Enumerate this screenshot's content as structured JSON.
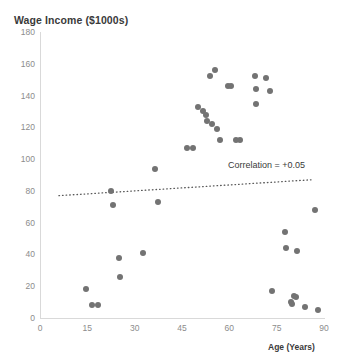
{
  "chart_data": {
    "type": "scatter",
    "title": "Wage Income ($1000s)",
    "xlabel": "Age (Years)",
    "ylabel": "",
    "xlim": [
      0,
      90
    ],
    "ylim": [
      0,
      180
    ],
    "xticks": [
      0,
      15,
      30,
      45,
      60,
      75,
      90
    ],
    "yticks": [
      0,
      20,
      40,
      60,
      80,
      100,
      120,
      140,
      160,
      180
    ],
    "grid": false,
    "legend": null,
    "marker_color": "#737373",
    "annotations": [
      {
        "text": "Correlation = +0.05",
        "x": 72,
        "y": 92
      }
    ],
    "trendline": {
      "style": "dotted",
      "color": "#595959",
      "x_start": 6,
      "y_start": 77,
      "x_end": 86,
      "y_end": 87
    },
    "points": [
      {
        "x": 14.5,
        "y": 18
      },
      {
        "x": 16.5,
        "y": 8
      },
      {
        "x": 18.5,
        "y": 8
      },
      {
        "x": 22.5,
        "y": 80
      },
      {
        "x": 23.0,
        "y": 71
      },
      {
        "x": 25.0,
        "y": 38
      },
      {
        "x": 25.5,
        "y": 26
      },
      {
        "x": 32.5,
        "y": 41
      },
      {
        "x": 36.5,
        "y": 94
      },
      {
        "x": 37.5,
        "y": 73
      },
      {
        "x": 46.5,
        "y": 107
      },
      {
        "x": 48.5,
        "y": 107
      },
      {
        "x": 50.0,
        "y": 133
      },
      {
        "x": 51.5,
        "y": 130
      },
      {
        "x": 52.5,
        "y": 128
      },
      {
        "x": 53.0,
        "y": 124
      },
      {
        "x": 54.5,
        "y": 122
      },
      {
        "x": 54.0,
        "y": 152
      },
      {
        "x": 55.5,
        "y": 156
      },
      {
        "x": 56.0,
        "y": 119
      },
      {
        "x": 57.0,
        "y": 112
      },
      {
        "x": 59.5,
        "y": 146
      },
      {
        "x": 60.5,
        "y": 146
      },
      {
        "x": 62.0,
        "y": 112
      },
      {
        "x": 63.5,
        "y": 112
      },
      {
        "x": 68.0,
        "y": 152
      },
      {
        "x": 68.5,
        "y": 144
      },
      {
        "x": 68.5,
        "y": 135
      },
      {
        "x": 71.5,
        "y": 151
      },
      {
        "x": 73.0,
        "y": 143
      },
      {
        "x": 73.5,
        "y": 17
      },
      {
        "x": 77.5,
        "y": 54
      },
      {
        "x": 78.0,
        "y": 44
      },
      {
        "x": 79.5,
        "y": 10
      },
      {
        "x": 80.0,
        "y": 9
      },
      {
        "x": 80.5,
        "y": 14
      },
      {
        "x": 81.0,
        "y": 13
      },
      {
        "x": 81.5,
        "y": 42
      },
      {
        "x": 84.0,
        "y": 7
      },
      {
        "x": 87.0,
        "y": 68
      },
      {
        "x": 88.0,
        "y": 5
      }
    ]
  }
}
